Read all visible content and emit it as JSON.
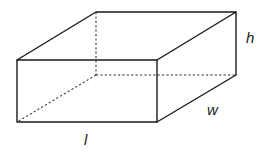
{
  "diagram": {
    "type": "rectangular-prism",
    "vertices": {
      "front_top_left": [
        17,
        60
      ],
      "front_top_right": [
        157,
        60
      ],
      "front_bottom_left": [
        17,
        122
      ],
      "front_bottom_right": [
        157,
        122
      ],
      "back_top_left": [
        96,
        12
      ],
      "back_top_right": [
        236,
        12
      ],
      "back_bottom_left": [
        96,
        75
      ],
      "back_bottom_right": [
        236,
        75
      ]
    },
    "labels": {
      "height": {
        "text": "h",
        "x": 246,
        "y": 43
      },
      "width": {
        "text": "w",
        "x": 208,
        "y": 115
      },
      "length": {
        "text": "l",
        "x": 84,
        "y": 145
      }
    },
    "colors": {
      "line": "#1a1a1a",
      "background": "#ffffff"
    }
  }
}
